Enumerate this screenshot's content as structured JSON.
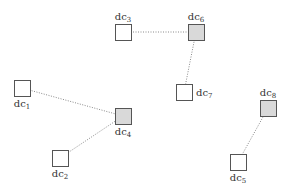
{
  "diagram": {
    "type": "cluster-graph",
    "nodes": [
      {
        "id": "dc1",
        "base": "dc",
        "sub": "1",
        "highlighted": false
      },
      {
        "id": "dc2",
        "base": "dc",
        "sub": "2",
        "highlighted": false
      },
      {
        "id": "dc3",
        "base": "dc",
        "sub": "3",
        "highlighted": false
      },
      {
        "id": "dc4",
        "base": "dc",
        "sub": "4",
        "highlighted": true
      },
      {
        "id": "dc5",
        "base": "dc",
        "sub": "5",
        "highlighted": false
      },
      {
        "id": "dc6",
        "base": "dc",
        "sub": "6",
        "highlighted": true
      },
      {
        "id": "dc7",
        "base": "dc",
        "sub": "7",
        "highlighted": false
      },
      {
        "id": "dc8",
        "base": "dc",
        "sub": "8",
        "highlighted": true
      }
    ],
    "edges": [
      {
        "from": "dc3",
        "to": "dc6",
        "style": "dotted"
      },
      {
        "from": "dc6",
        "to": "dc7",
        "style": "dotted"
      },
      {
        "from": "dc1",
        "to": "dc4",
        "style": "dotted"
      },
      {
        "from": "dc2",
        "to": "dc4",
        "style": "dotted"
      },
      {
        "from": "dc8",
        "to": "dc5",
        "style": "dotted"
      }
    ],
    "colors": {
      "highlight_fill": "#d9d9d9",
      "normal_fill": "#ffffff",
      "stroke": "#555555",
      "edge": "#8a8a8a",
      "text": "#333333"
    }
  }
}
